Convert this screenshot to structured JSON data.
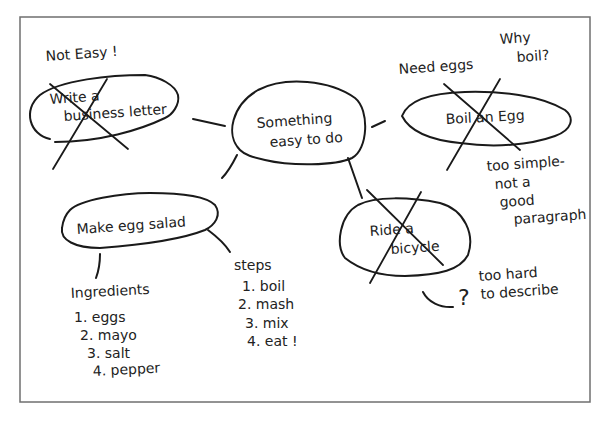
{
  "diagram": {
    "type": "cluster-map",
    "center": {
      "label_lines": [
        "Something",
        "easy to do"
      ]
    },
    "topics": [
      {
        "id": "business-letter",
        "label_lines": [
          "Write a",
          "business letter"
        ],
        "crossed_out": true,
        "notes": [
          "Not Easy !"
        ]
      },
      {
        "id": "boil-egg",
        "label_lines": [
          "Boil an Egg"
        ],
        "crossed_out": true,
        "notes": [
          "Need eggs",
          "Why",
          "boil?",
          "too simple-",
          "not a",
          "good",
          "paragraph"
        ]
      },
      {
        "id": "egg-salad",
        "label_lines": [
          "Make egg salad"
        ],
        "crossed_out": false,
        "branches": [
          {
            "title": "Ingredients",
            "items": [
              "1.  eggs",
              "2. mayo",
              "3. salt",
              "4. pepper"
            ]
          },
          {
            "title": "steps",
            "items": [
              "1.  boil",
              "2. mash",
              "3. mix",
              "4. eat !"
            ]
          }
        ]
      },
      {
        "id": "bicycle",
        "label_lines": [
          "Ride a",
          "bicycle"
        ],
        "crossed_out": true,
        "notes": [
          "too hard",
          "to describe",
          "?"
        ]
      }
    ]
  }
}
